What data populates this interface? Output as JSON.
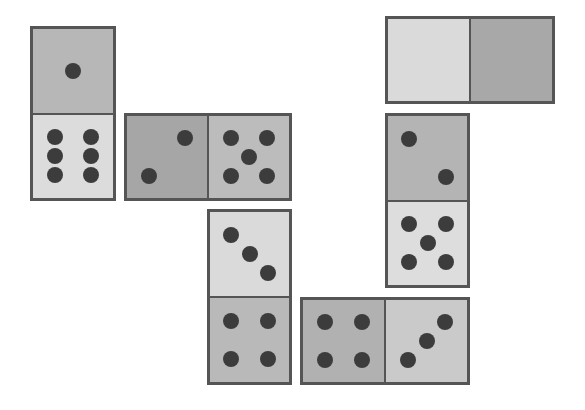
{
  "board": {
    "pip_color": "#3c3c3c",
    "border_color": "#555555",
    "dominoes": [
      {
        "id": "d1",
        "orientation": "vertical",
        "x": 30,
        "y": 26,
        "w": 86,
        "h": 175,
        "halves": [
          {
            "value": 1,
            "color": "#b7b7b7"
          },
          {
            "value": 6,
            "color": "#dcdcdc"
          }
        ]
      },
      {
        "id": "d2",
        "orientation": "horizontal",
        "x": 124,
        "y": 113,
        "w": 168,
        "h": 88,
        "halves": [
          {
            "value": 2,
            "color": "#a6a6a6"
          },
          {
            "value": 5,
            "color": "#bcbcbc"
          }
        ]
      },
      {
        "id": "d3",
        "orientation": "horizontal",
        "x": 385,
        "y": 16,
        "w": 170,
        "h": 88,
        "halves": [
          {
            "value": 0,
            "color": "#dadada"
          },
          {
            "value": 0,
            "color": "#a8a8a8"
          }
        ]
      },
      {
        "id": "d4",
        "orientation": "vertical",
        "x": 385,
        "y": 113,
        "w": 85,
        "h": 175,
        "halves": [
          {
            "value": 2,
            "color": "#b4b4b4"
          },
          {
            "value": 5,
            "color": "#dddddd"
          }
        ]
      },
      {
        "id": "d5",
        "orientation": "vertical",
        "x": 207,
        "y": 209,
        "w": 85,
        "h": 176,
        "halves": [
          {
            "value": 3,
            "color": "#dadada"
          },
          {
            "value": 4,
            "color": "#b9b9b9"
          }
        ]
      },
      {
        "id": "d6",
        "orientation": "horizontal",
        "x": 300,
        "y": 297,
        "w": 170,
        "h": 88,
        "halves": [
          {
            "value": 4,
            "color": "#b1b1b1"
          },
          {
            "value": 3,
            "color": "#cacaca"
          }
        ]
      }
    ]
  }
}
